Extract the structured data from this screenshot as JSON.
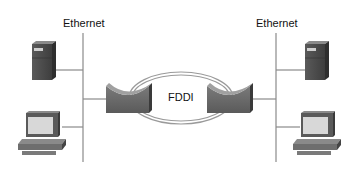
{
  "diagram": {
    "left_segment": {
      "label": "Ethernet"
    },
    "right_segment": {
      "label": "Ethernet"
    },
    "ring": {
      "label": "FDDI"
    }
  },
  "colors": {
    "line": "#8a8a8a",
    "device_dark": "#4a4a4a",
    "device_mid": "#6e6e6e",
    "screen": "#d8d8d8",
    "ring": "#9a9a9a"
  },
  "nodes": [
    {
      "id": "left-server",
      "icon": "server-icon"
    },
    {
      "id": "left-workstation",
      "icon": "workstation-icon"
    },
    {
      "id": "left-router",
      "icon": "fddi-concentrator-icon"
    },
    {
      "id": "right-router",
      "icon": "fddi-concentrator-icon"
    },
    {
      "id": "right-server",
      "icon": "server-icon"
    },
    {
      "id": "right-workstation",
      "icon": "workstation-icon"
    }
  ]
}
